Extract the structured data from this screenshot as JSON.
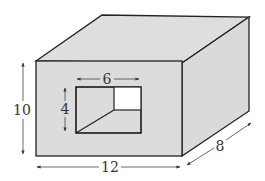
{
  "diagram": {
    "type": "3D rectangular box with rectangular hole (tunnel) through front face",
    "colors": {
      "face_fill": "#dcdcdc",
      "top_fill": "#dedede",
      "side_fill": "#dadada",
      "hole_opening": "#ffffff",
      "stroke": "#222222",
      "dimension_line": "#444444"
    },
    "dimensions": {
      "height_label": "10",
      "width_label": "12",
      "depth_label": "8",
      "hole_width_label": "6",
      "hole_height_label": "4"
    }
  }
}
